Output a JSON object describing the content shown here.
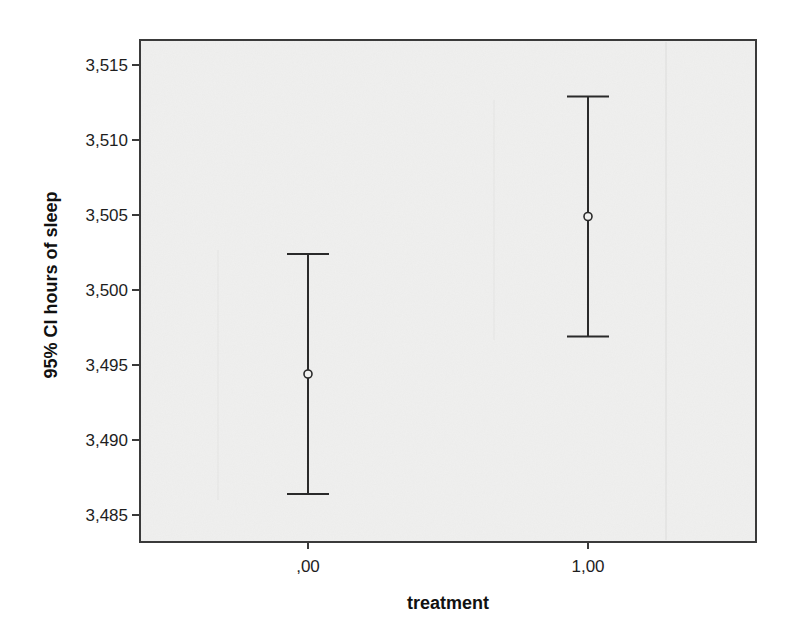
{
  "chart_data": {
    "type": "errorbar",
    "title": "",
    "xlabel": "treatment",
    "ylabel": "95% CI hours of sleep",
    "categories": [
      ",00",
      "1,00"
    ],
    "series": [
      {
        "name": "95% CI hours of sleep",
        "mean": [
          3.4944,
          3.5049
        ],
        "ci_lower": [
          3.4864,
          3.4969
        ],
        "ci_upper": [
          3.5024,
          3.5129
        ]
      }
    ],
    "ylim": [
      3.4833,
      3.5178
    ],
    "yticks": [
      3.485,
      3.49,
      3.495,
      3.5,
      3.505,
      3.51,
      3.515
    ],
    "ytick_labels": [
      "3,485",
      "3,490",
      "3,495",
      "3,500",
      "3,505",
      "3,510",
      "3,515"
    ],
    "grid": false,
    "legend": "none",
    "marker": "open-circle"
  },
  "colors": {
    "plot_background": "#f0f0ef",
    "frame": "#3a3a3a",
    "bars": "#2a2a2a",
    "text": "#1e1e1e",
    "ghost": "#d6d6d4"
  }
}
